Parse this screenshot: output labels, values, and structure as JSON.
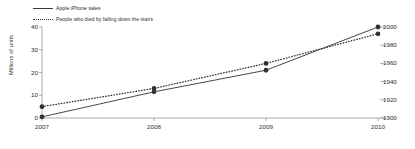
{
  "chart_data": {
    "type": "line",
    "title": "",
    "xlabel": "",
    "ylabel": "Millions of units",
    "x": [
      2007,
      2008,
      2009,
      2010
    ],
    "categories": [
      "2007",
      "2008",
      "2009",
      "2010"
    ],
    "xlim": [
      2007,
      2010
    ],
    "ylim": [
      0,
      40
    ],
    "y_right_lim": [
      1900,
      2000
    ],
    "grid": false,
    "legend_position": "top-left",
    "series": [
      {
        "name": "Apple iPhone sales",
        "style": "solid",
        "axis": "left",
        "marker": "filled-circle",
        "color": "#333333",
        "values": [
          0.5,
          11.5,
          21.0,
          40.0
        ]
      },
      {
        "name": "People who died by falling down the stairs",
        "style": "dotted",
        "axis": "right",
        "marker": "filled-circle",
        "color": "#333333",
        "values": [
          5.0,
          13.0,
          24.0,
          37.0
        ]
      }
    ],
    "y_left_ticks": [
      "0",
      "10",
      "20",
      "30",
      "40"
    ],
    "y_left_tick_values": [
      0,
      10,
      20,
      30,
      40
    ],
    "y_right_ticks": [
      "1900",
      "1920",
      "1940",
      "1960",
      "1980",
      "2000"
    ],
    "y_right_tick_values": [
      1900,
      1920,
      1940,
      1960,
      1980,
      2000
    ],
    "x_ticks": [
      "2007",
      "2008",
      "2009",
      "2010"
    ]
  },
  "legend": {
    "items": [
      {
        "label": "Apple iPhone sales",
        "style": "solid"
      },
      {
        "label": "People who died by falling down the stairs",
        "style": "dotted"
      }
    ]
  },
  "axes": {
    "y_left_label": "Millions of units"
  }
}
